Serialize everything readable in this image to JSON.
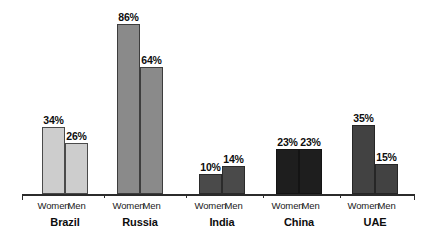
{
  "chart_data": {
    "type": "bar",
    "title": "",
    "subtitle": "",
    "xlabel": "",
    "ylabel": "",
    "ylim": [
      0,
      100
    ],
    "grid": false,
    "legend_position": "none",
    "categories": [
      "Brazil",
      "Russia",
      "India",
      "China",
      "UAE"
    ],
    "series": [
      {
        "name": "Women",
        "values": [
          34,
          86,
          10,
          23,
          35
        ]
      },
      {
        "name": "Men",
        "values": [
          26,
          64,
          14,
          23,
          15
        ]
      }
    ],
    "value_labels": [
      "34%",
      "26%",
      "86%",
      "64%",
      "10%",
      "14%",
      "23%",
      "23%",
      "35%",
      "15%"
    ],
    "group_colors": [
      "#cdcdcd",
      "#8a8a8a",
      "#4a4a4a",
      "#1e1e1e",
      "#424242"
    ],
    "group_border_colors": [
      "#4a4a4a",
      "#3d3d3d",
      "#2b2b2b",
      "#141414",
      "#262626"
    ],
    "axis_color": "#2b2b2b",
    "background": "#ffffff"
  },
  "bars": [
    {
      "label": "34%",
      "value": 34,
      "series": "Women",
      "category": "Brazil"
    },
    {
      "label": "26%",
      "value": 26,
      "series": "Men",
      "category": "Brazil"
    },
    {
      "label": "86%",
      "value": 86,
      "series": "Women",
      "category": "Russia"
    },
    {
      "label": "64%",
      "value": 64,
      "series": "Men",
      "category": "Russia"
    },
    {
      "label": "10%",
      "value": 10,
      "series": "Women",
      "category": "India"
    },
    {
      "label": "14%",
      "value": 14,
      "series": "Men",
      "category": "India"
    },
    {
      "label": "23%",
      "value": 23,
      "series": "Women",
      "category": "China"
    },
    {
      "label": "23%",
      "value": 23,
      "series": "Men",
      "category": "China"
    },
    {
      "label": "35%",
      "value": 35,
      "series": "Women",
      "category": "UAE"
    },
    {
      "label": "15%",
      "value": 15,
      "series": "Men",
      "category": "UAE"
    }
  ],
  "groups": [
    {
      "category": "Brazil",
      "women_label": "Women",
      "men_label": "Men"
    },
    {
      "category": "Russia",
      "women_label": "Women",
      "men_label": "Men"
    },
    {
      "category": "India",
      "women_label": "Women",
      "men_label": "Men"
    },
    {
      "category": "China",
      "women_label": "Women",
      "men_label": "Men"
    },
    {
      "category": "UAE",
      "women_label": "Women",
      "men_label": "Men"
    }
  ]
}
